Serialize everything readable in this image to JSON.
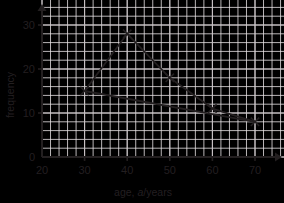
{
  "chart_data": {
    "type": "line",
    "title": "",
    "subtitle": "",
    "xlabel": "age, a/years",
    "xlabel_parts": {
      "pre": "age, ",
      "italic": "a",
      "post": "/years"
    },
    "ylabel": "frequency",
    "xlim": [
      20,
      72
    ],
    "ylim": [
      0,
      32
    ],
    "xticks": [
      20,
      30,
      40,
      50,
      60,
      70
    ],
    "xtick_labels": [
      "20",
      "30",
      "40",
      "50",
      "60",
      "70"
    ],
    "yticks": [
      0,
      10,
      20,
      30
    ],
    "ytick_labels": [
      "0",
      "10",
      "20",
      "30"
    ],
    "grid": true,
    "grid_minor_step_x": 2,
    "grid_minor_step_y": 2,
    "grid_major_step_x": 10,
    "grid_major_step_y": 10,
    "legend": false,
    "legend_position": "none",
    "marker": "x-cross",
    "series": [
      {
        "name": "frequency polygon",
        "x": [
          30,
          40,
          50,
          60,
          70
        ],
        "values": [
          15,
          28,
          18,
          11,
          8
        ],
        "points": [
          [
            30,
            15
          ],
          [
            40,
            28
          ],
          [
            50,
            18
          ],
          [
            60,
            11
          ],
          [
            70,
            8
          ]
        ]
      },
      {
        "name": "trend line",
        "x": [
          30,
          70
        ],
        "values": [
          15,
          8
        ],
        "points": [
          [
            30,
            15
          ],
          [
            70,
            8
          ]
        ]
      }
    ],
    "annotations": []
  },
  "style": {
    "background": "#ffffff",
    "grid_minor_color": "#e9e3e6",
    "grid_major_color": "#c9c3c6",
    "axis_color": "#231f20",
    "series_color": "#231f20",
    "text_color": "#231f20"
  },
  "icons": {
    "x_axis_arrow": "arrow-right-icon",
    "y_axis_arrow": "arrow-up-icon",
    "data_marker": "cross-marker-icon"
  }
}
